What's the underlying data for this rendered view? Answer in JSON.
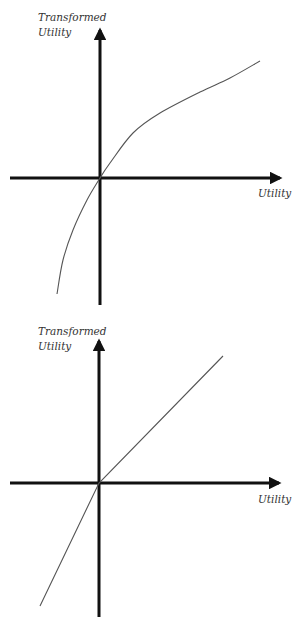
{
  "colors": {
    "background": "#ffffff",
    "axis": "#111111",
    "curve": "#555555",
    "label": "#333333"
  },
  "chart_data": [
    {
      "type": "line",
      "title": "",
      "ylabel_line1": "Transformed",
      "ylabel_line2": "Utility",
      "xlabel": "Utility",
      "description": "Concave (logarithmic-like) transformation of utility passing through the origin",
      "grid": false,
      "series": [
        {
          "name": "concave transform",
          "points_px": [
            [
              57,
              294
            ],
            [
              63,
              260
            ],
            [
              73,
              230
            ],
            [
              87,
              200
            ],
            [
              100,
              178
            ],
            [
              110,
              163
            ],
            [
              133,
              133
            ],
            [
              160,
              113
            ],
            [
              200,
              92
            ],
            [
              230,
              78
            ],
            [
              260,
              61
            ]
          ]
        }
      ]
    },
    {
      "type": "line",
      "title": "",
      "ylabel_line1": "Transformed",
      "ylabel_line2": "Utility",
      "xlabel": "Utility",
      "description": "Piecewise linear (kinked) transformation: steeper below origin, shallower above",
      "grid": false,
      "series": [
        {
          "name": "piecewise linear transform",
          "points_px": [
            [
              40,
              606
            ],
            [
              99,
              483
            ],
            [
              223,
              356
            ]
          ]
        }
      ]
    }
  ]
}
